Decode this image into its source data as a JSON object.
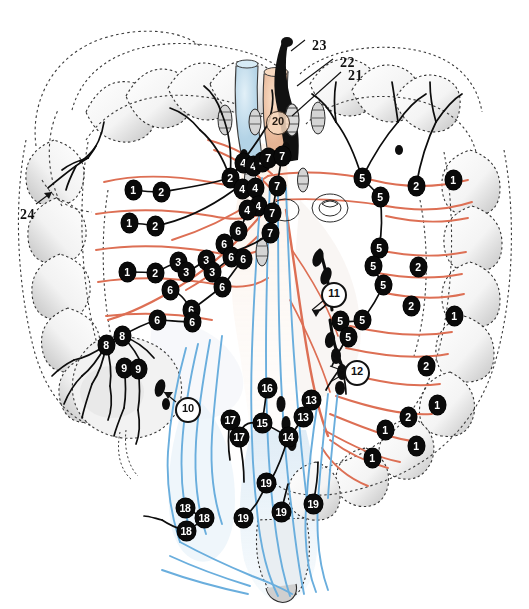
{
  "figure": {
    "background_color": "#ffffff",
    "colors": {
      "artery": "#dd6f54",
      "vein": "#6aaedd",
      "lymphatic": "#0d0d0d",
      "outline": "#2b2b2b",
      "haustra_shade": "#bdbdbd",
      "mesentery_tan": "#c9ab93",
      "tube_peach": "#f0cbae",
      "tube_blue": "#c2dced",
      "node_fill": "#0a0a0a",
      "node_text": "#ffffff"
    }
  },
  "nodes": [
    {
      "label": "2",
      "x": 230,
      "y": 178,
      "style": "filled"
    },
    {
      "label": "1",
      "x": 133,
      "y": 190,
      "style": "filled"
    },
    {
      "label": "2",
      "x": 161,
      "y": 192,
      "style": "filled"
    },
    {
      "label": "1",
      "x": 129,
      "y": 223,
      "style": "filled"
    },
    {
      "label": "2",
      "x": 155,
      "y": 226,
      "style": "filled"
    },
    {
      "label": "1",
      "x": 127,
      "y": 272,
      "style": "filled"
    },
    {
      "label": "2",
      "x": 155,
      "y": 273,
      "style": "filled"
    },
    {
      "label": "3",
      "x": 178,
      "y": 262,
      "style": "filled"
    },
    {
      "label": "3",
      "x": 186,
      "y": 272,
      "style": "filled"
    },
    {
      "label": "3",
      "x": 206,
      "y": 260,
      "style": "filled"
    },
    {
      "label": "3",
      "x": 212,
      "y": 272,
      "style": "filled"
    },
    {
      "label": "4",
      "x": 243,
      "y": 163,
      "style": "filled"
    },
    {
      "label": "4",
      "x": 253,
      "y": 166,
      "style": "filled"
    },
    {
      "label": "4",
      "x": 262,
      "y": 162,
      "style": "filled"
    },
    {
      "label": "4",
      "x": 242,
      "y": 189,
      "style": "filled"
    },
    {
      "label": "4",
      "x": 255,
      "y": 188,
      "style": "filled"
    },
    {
      "label": "4",
      "x": 258,
      "y": 206,
      "style": "filled"
    },
    {
      "label": "4",
      "x": 247,
      "y": 210,
      "style": "filled"
    },
    {
      "label": "7",
      "x": 268,
      "y": 158,
      "style": "filled"
    },
    {
      "label": "7",
      "x": 282,
      "y": 156,
      "style": "filled"
    },
    {
      "label": "7",
      "x": 277,
      "y": 186,
      "style": "filled"
    },
    {
      "label": "7",
      "x": 272,
      "y": 213,
      "style": "filled"
    },
    {
      "label": "7",
      "x": 270,
      "y": 233,
      "style": "filled"
    },
    {
      "label": "6",
      "x": 224,
      "y": 244,
      "style": "filled"
    },
    {
      "label": "6",
      "x": 231,
      "y": 257,
      "style": "filled"
    },
    {
      "label": "6",
      "x": 238,
      "y": 231,
      "style": "filled"
    },
    {
      "label": "6",
      "x": 243,
      "y": 259,
      "style": "filled"
    },
    {
      "label": "6",
      "x": 222,
      "y": 287,
      "style": "filled"
    },
    {
      "label": "6",
      "x": 191,
      "y": 310,
      "style": "filled"
    },
    {
      "label": "6",
      "x": 170,
      "y": 290,
      "style": "filled"
    },
    {
      "label": "6",
      "x": 192,
      "y": 322,
      "style": "filled"
    },
    {
      "label": "6",
      "x": 157,
      "y": 320,
      "style": "filled"
    },
    {
      "label": "8",
      "x": 122,
      "y": 336,
      "style": "filled"
    },
    {
      "label": "8",
      "x": 106,
      "y": 345,
      "style": "filled"
    },
    {
      "label": "9",
      "x": 124,
      "y": 368,
      "style": "filled"
    },
    {
      "label": "9",
      "x": 138,
      "y": 369,
      "style": "filled"
    },
    {
      "label": "5",
      "x": 362,
      "y": 178,
      "style": "filled"
    },
    {
      "label": "5",
      "x": 380,
      "y": 197,
      "style": "filled"
    },
    {
      "label": "5",
      "x": 379,
      "y": 248,
      "style": "filled"
    },
    {
      "label": "5",
      "x": 373,
      "y": 266,
      "style": "filled"
    },
    {
      "label": "5",
      "x": 383,
      "y": 285,
      "style": "filled"
    },
    {
      "label": "5",
      "x": 340,
      "y": 321,
      "style": "filled"
    },
    {
      "label": "5",
      "x": 362,
      "y": 320,
      "style": "filled"
    },
    {
      "label": "5",
      "x": 348,
      "y": 337,
      "style": "filled"
    },
    {
      "label": "2",
      "x": 416,
      "y": 186,
      "style": "filled"
    },
    {
      "label": "2",
      "x": 418,
      "y": 267,
      "style": "filled"
    },
    {
      "label": "2",
      "x": 411,
      "y": 306,
      "style": "filled"
    },
    {
      "label": "2",
      "x": 426,
      "y": 366,
      "style": "filled"
    },
    {
      "label": "2",
      "x": 408,
      "y": 417,
      "style": "filled"
    },
    {
      "label": "1",
      "x": 453,
      "y": 180,
      "style": "filled"
    },
    {
      "label": "1",
      "x": 454,
      "y": 316,
      "style": "filled"
    },
    {
      "label": "1",
      "x": 437,
      "y": 405,
      "style": "filled"
    },
    {
      "label": "1",
      "x": 416,
      "y": 446,
      "style": "filled"
    },
    {
      "label": "1",
      "x": 372,
      "y": 458,
      "style": "filled"
    },
    {
      "label": "1",
      "x": 385,
      "y": 430,
      "style": "filled"
    },
    {
      "label": "13",
      "x": 311,
      "y": 400,
      "style": "filled"
    },
    {
      "label": "13",
      "x": 303,
      "y": 417,
      "style": "filled"
    },
    {
      "label": "14",
      "x": 288,
      "y": 437,
      "style": "filled"
    },
    {
      "label": "15",
      "x": 262,
      "y": 423,
      "style": "filled"
    },
    {
      "label": "16",
      "x": 267,
      "y": 388,
      "style": "filled"
    },
    {
      "label": "17",
      "x": 230,
      "y": 420,
      "style": "filled"
    },
    {
      "label": "17",
      "x": 239,
      "y": 437,
      "style": "filled"
    },
    {
      "label": "19",
      "x": 266,
      "y": 483,
      "style": "filled"
    },
    {
      "label": "19",
      "x": 243,
      "y": 518,
      "style": "filled"
    },
    {
      "label": "19",
      "x": 281,
      "y": 512,
      "style": "filled"
    },
    {
      "label": "19",
      "x": 313,
      "y": 504,
      "style": "filled"
    },
    {
      "label": "18",
      "x": 185,
      "y": 508,
      "style": "filled"
    },
    {
      "label": "18",
      "x": 204,
      "y": 518,
      "style": "filled"
    },
    {
      "label": "18",
      "x": 186,
      "y": 531,
      "style": "filled"
    }
  ],
  "callouts": [
    {
      "label": "10",
      "x": 186,
      "y": 408,
      "style": "open-circle",
      "note": "leader tail points up-left"
    },
    {
      "label": "11",
      "x": 332,
      "y": 293,
      "style": "open-circle",
      "note": "leader tail points down-left"
    },
    {
      "label": "12",
      "x": 355,
      "y": 371,
      "style": "open-circle",
      "note": "leader tail points left"
    },
    {
      "label": "20",
      "x": 277,
      "y": 122,
      "style": "thin-circle",
      "note": "on peach arterial trunk"
    }
  ],
  "leader_labels": [
    {
      "label": "23",
      "x": 312,
      "y": 38,
      "line_to_x": 291,
      "line_to_y": 52
    },
    {
      "label": "22",
      "x": 340,
      "y": 55,
      "line_to_x": 297,
      "line_to_y": 84
    },
    {
      "label": "21",
      "x": 348,
      "y": 68,
      "line_to_x": 291,
      "line_to_y": 117
    },
    {
      "label": "24",
      "x": 20,
      "y": 207,
      "line_to_x": 48,
      "line_to_y": 188
    }
  ]
}
